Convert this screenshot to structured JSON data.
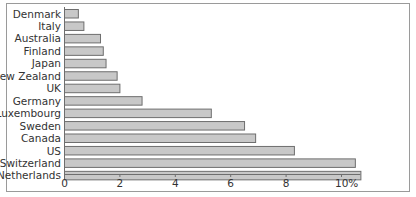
{
  "chart_data": {
    "type": "bar",
    "orientation": "horizontal",
    "title": "",
    "xlabel": "",
    "ylabel": "",
    "categories": [
      "Denmark",
      "Italy",
      "Australia",
      "Finland",
      "Japan",
      "New Zealand",
      "UK",
      "Germany",
      "Luxembourg",
      "Sweden",
      "Canada",
      "US",
      "Switzerland",
      "Netherlands"
    ],
    "values": [
      0.5,
      0.7,
      1.3,
      1.4,
      1.5,
      1.9,
      2.0,
      2.8,
      5.3,
      6.5,
      6.9,
      8.3,
      10.5,
      10.7
    ],
    "xlim": [
      0,
      10.7
    ],
    "xticks": [
      0,
      2,
      4,
      6,
      8,
      10
    ],
    "xtick_labels": [
      "0",
      "2",
      "4",
      "6",
      "8",
      "10%"
    ],
    "unit": "%",
    "grid": false,
    "legend": "none",
    "colors": {
      "bar_fill": "#c8c8c8",
      "bar_stroke": "#6e6e6e",
      "axis": "#6e6e6e",
      "text": "#333333"
    }
  }
}
